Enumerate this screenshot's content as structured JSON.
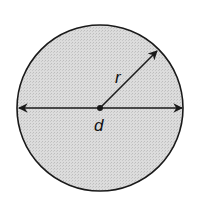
{
  "diagram": {
    "labels": {
      "radius": "r",
      "diameter": "d"
    },
    "colors": {
      "fill": "#d4d4d4",
      "stroke": "#1a1a1a",
      "background": "#ffffff"
    }
  }
}
